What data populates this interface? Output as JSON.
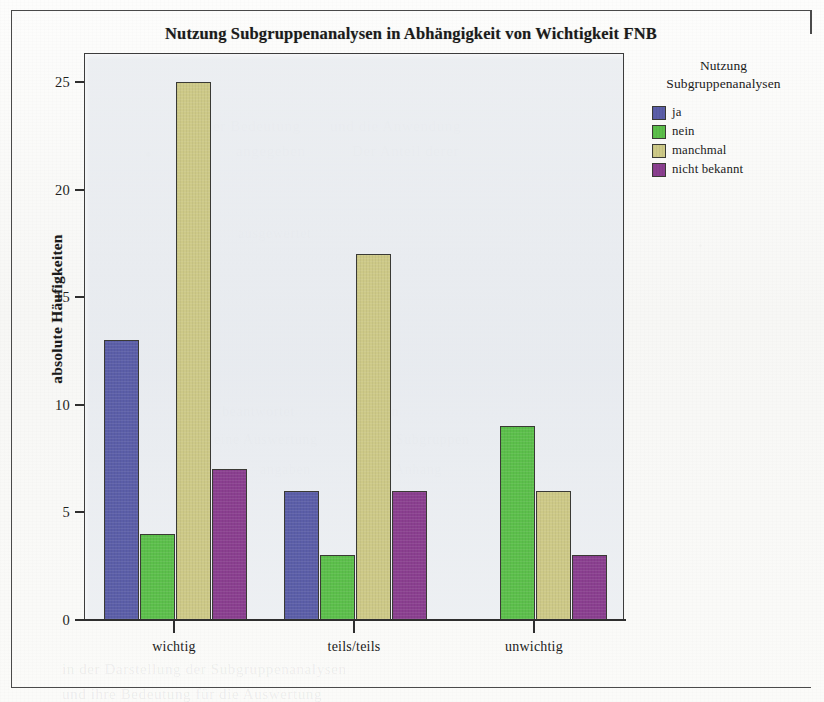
{
  "figure": {
    "title": "Nutzung Subgruppenanalysen in Abhängigkeit von Wichtigkeit FNB"
  },
  "legend": {
    "title_line1": "Nutzung",
    "title_line2": "Subgruppenanalysen"
  },
  "chart_data": {
    "type": "bar",
    "title": "Nutzung Subgruppenanalysen in Abhängigkeit von Wichtigkeit FNB",
    "xlabel": "",
    "ylabel": "absolute Häufigkeiten",
    "categories": [
      "wichtig",
      "teils/teils",
      "unwichtig"
    ],
    "series": [
      {
        "name": "ja",
        "color": "#5b5ea8",
        "values": [
          13,
          6,
          0
        ]
      },
      {
        "name": "nein",
        "color": "#5cbf4b",
        "values": [
          4,
          3,
          9
        ]
      },
      {
        "name": "manchmal",
        "color": "#cdc987",
        "values": [
          25,
          17,
          6
        ]
      },
      {
        "name": "nicht bekannt",
        "color": "#8a3f8f",
        "values": [
          7,
          6,
          3
        ]
      }
    ],
    "ylim": [
      0,
      26.4
    ],
    "yticks": [
      0,
      5,
      10,
      15,
      20,
      25
    ],
    "ytick_labels": [
      "0",
      "5",
      "10",
      "15",
      "20",
      "25"
    ],
    "grid": false,
    "legend_position": "right",
    "grouped": true
  },
  "ghost_text": [
    {
      "text": "der Bedeutung",
      "x": 205,
      "y": 118,
      "size": 15
    },
    {
      "text": "und die Anwendung",
      "x": 330,
      "y": 118,
      "size": 15
    },
    {
      "text": "angegeben",
      "x": 236,
      "y": 143,
      "size": 15
    },
    {
      "text": "Der Anteil derer",
      "x": 352,
      "y": 143,
      "size": 15
    },
    {
      "text": "ausgewertet",
      "x": 238,
      "y": 226,
      "size": 14
    },
    {
      "text": "beantwortet",
      "x": 222,
      "y": 404,
      "size": 14
    },
    {
      "text": "Studien",
      "x": 352,
      "y": 404,
      "size": 14
    },
    {
      "text": "eine Auswertung",
      "x": 214,
      "y": 432,
      "size": 14
    },
    {
      "text": "der Subgruppen",
      "x": 372,
      "y": 432,
      "size": 14
    },
    {
      "text": "angaben",
      "x": 260,
      "y": 462,
      "size": 14
    },
    {
      "text": "Anhang",
      "x": 394,
      "y": 462,
      "size": 14
    },
    {
      "text": "in der Darstellung der Subgruppenanalysen",
      "x": 62,
      "y": 661,
      "size": 15
    },
    {
      "text": "und ihre Bedeutung für die Auswertung",
      "x": 62,
      "y": 686,
      "size": 15
    }
  ]
}
